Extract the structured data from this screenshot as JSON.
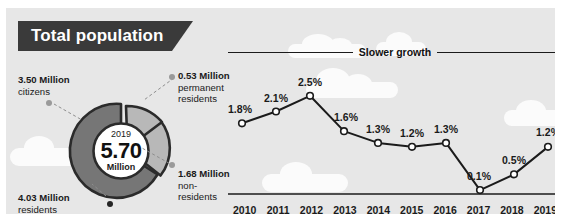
{
  "title": {
    "text": "Total population"
  },
  "colors": {
    "background": "#e7e7e7",
    "frame": "#ffffff",
    "ribbon": "#3a3a3a",
    "ribbon_text": "#ffffff",
    "donut_dark": "#767676",
    "donut_light": "#b8b8b8",
    "donut_outline": "#2b2b2b",
    "line": "#1b1b1b",
    "marker_fill": "#ffffff",
    "text": "#1a1a1a",
    "dot_gray": "#9a9a9a",
    "dot_dark": "#252525"
  },
  "donut": {
    "center_year": "2019",
    "center_value": "5.70",
    "center_unit": "Million",
    "segments": [
      {
        "name": "residents",
        "value_label": "4.03 Million",
        "label_line1": "4.03 Million",
        "label_line2": "residents",
        "value": 4.03,
        "color": "#767676",
        "dot": "dot-dark"
      },
      {
        "name": "citizens",
        "value_label": "3.50 Million",
        "label_line1": "3.50 Million",
        "label_line2": "citizens",
        "value": 3.5,
        "color": "#767676",
        "dot": "dot-gray"
      },
      {
        "name": "permanent-residents",
        "value_label": "0.53 Million",
        "label_line1": "0.53 Million",
        "label_line2": "permanent",
        "label_line3": "residents",
        "value": 0.53,
        "color": "#b8b8b8",
        "dot": "dot-gray"
      },
      {
        "name": "non-residents",
        "value_label": "1.68 Million",
        "label_line1": "1.68 Million",
        "label_line2": "non-",
        "label_line3": "residents",
        "value": 1.68,
        "color": "#b8b8b8",
        "dot": "dot-gray"
      }
    ]
  },
  "chart_data": {
    "type": "line",
    "title": "Slower growth",
    "xlabel": "",
    "ylabel": "",
    "categories": [
      "2010",
      "2011",
      "2012",
      "2013",
      "2014",
      "2015",
      "2016",
      "2017",
      "2018",
      "2019"
    ],
    "values": [
      1.8,
      2.1,
      2.5,
      1.6,
      1.3,
      1.2,
      1.3,
      0.1,
      0.5,
      1.2
    ],
    "point_labels": [
      "1.8%",
      "2.1%",
      "2.5%",
      "1.6%",
      "1.3%",
      "1.2%",
      "1.3%",
      "0.1%",
      "0.5%",
      "1.2%"
    ],
    "ylim": [
      0,
      2.8
    ],
    "grid": false,
    "legend": null,
    "series": [
      {
        "name": "Population growth rate",
        "values": [
          1.8,
          2.1,
          2.5,
          1.6,
          1.3,
          1.2,
          1.3,
          0.1,
          0.5,
          1.2
        ]
      }
    ]
  }
}
